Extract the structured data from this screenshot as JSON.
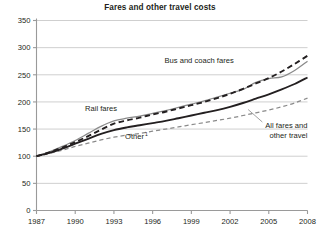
{
  "chart_data": {
    "type": "line",
    "title": "Fares and other travel costs",
    "xlabel": "",
    "ylabel": "",
    "xlim": [
      1987,
      2008
    ],
    "ylim": [
      0,
      350
    ],
    "grid": true,
    "legend_position": "inline-annotations",
    "x": [
      1987,
      1988,
      1989,
      1990,
      1991,
      1992,
      1993,
      1994,
      1995,
      1996,
      1997,
      1998,
      1999,
      2000,
      2001,
      2002,
      2003,
      2004,
      2005,
      2006,
      2007,
      2008
    ],
    "xticks": [
      "1987",
      "1990",
      "1993",
      "1996",
      "1999",
      "2002",
      "2005",
      "2008"
    ],
    "xtick_values": [
      1987,
      1990,
      1993,
      1996,
      1999,
      2002,
      2005,
      2008
    ],
    "yticks": [
      "0",
      "50",
      "100",
      "150",
      "200",
      "250",
      "300",
      "350"
    ],
    "ytick_values": [
      0,
      50,
      100,
      150,
      200,
      250,
      300,
      350
    ],
    "series": [
      {
        "name": "Bus and coach fares",
        "style": "dashed",
        "color": "#231f20",
        "values": [
          100,
          107,
          116,
          126,
          137,
          149,
          160,
          166,
          171,
          177,
          182,
          188,
          194,
          200,
          207,
          215,
          224,
          234,
          244,
          256,
          270,
          285
        ],
        "label_x": 1999.6,
        "label_y": 272
      },
      {
        "name": "Rail fares",
        "style": "solid",
        "color": "#8a8a8a",
        "values": [
          100,
          108,
          118,
          129,
          142,
          155,
          165,
          170,
          174,
          179,
          184,
          190,
          196,
          202,
          209,
          216,
          223,
          236,
          243,
          246,
          258,
          275
        ],
        "label_x": 1992.0,
        "label_y": 183
      },
      {
        "name": "All fares and other travel",
        "style": "solid",
        "color": "#231f20",
        "values": [
          100,
          106,
          114,
          123,
          132,
          141,
          148,
          153,
          157,
          161,
          165,
          170,
          175,
          180,
          185,
          191,
          198,
          206,
          214,
          223,
          233,
          245
        ],
        "label_x": 2004.3,
        "label_y": 152
      },
      {
        "name": "Other",
        "footnote": "1",
        "style": "dashed",
        "color": "#8a8a8a",
        "values": [
          100,
          105,
          111,
          118,
          124,
          130,
          135,
          139,
          142,
          146,
          150,
          154,
          158,
          162,
          166,
          170,
          175,
          180,
          185,
          191,
          198,
          207
        ],
        "label_x": 1994.6,
        "label_y": 131
      }
    ],
    "annotations": [
      {
        "text": "Bus and coach fares",
        "series": "Bus and coach fares"
      },
      {
        "text": "Rail fares",
        "series": "Rail fares"
      },
      {
        "text": "All fares and",
        "text2": "other travel",
        "series": "All fares and other travel"
      },
      {
        "text": "Other",
        "superscript": "1",
        "series": "Other"
      }
    ]
  }
}
